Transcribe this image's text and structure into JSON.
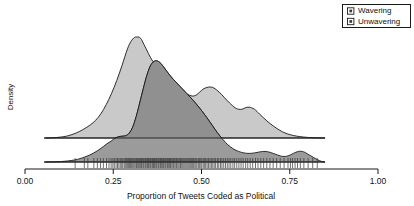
{
  "chart_data": {
    "type": "area",
    "title": "",
    "subtitle": "",
    "xlabel": "Proportion of Tweets Coded as Political",
    "ylabel": "Density",
    "xlim": [
      0.0,
      1.0
    ],
    "ylim": [
      0,
      1
    ],
    "grid": false,
    "legend_position": "top-right",
    "xticks": [
      0.0,
      0.25,
      0.5,
      0.75,
      1.0
    ],
    "xticklabels": [
      "0.00",
      "0.25",
      "0.50",
      "0.75",
      "1.00"
    ],
    "yticks": [],
    "yticklabels": [],
    "series": [
      {
        "name": "Wavering",
        "fill": "#c9c9c9",
        "stroke": "#1a1a1a",
        "baseline_y": 138,
        "x": [
          0.055,
          0.09,
          0.12,
          0.145,
          0.165,
          0.185,
          0.2,
          0.215,
          0.23,
          0.245,
          0.26,
          0.275,
          0.29,
          0.3,
          0.31,
          0.32,
          0.325,
          0.33,
          0.335,
          0.345,
          0.355,
          0.365,
          0.375,
          0.385,
          0.4,
          0.415,
          0.43,
          0.445,
          0.455,
          0.465,
          0.475,
          0.485,
          0.495,
          0.505,
          0.515,
          0.525,
          0.535,
          0.55,
          0.565,
          0.58,
          0.595,
          0.605,
          0.615,
          0.625,
          0.635,
          0.65,
          0.665,
          0.685,
          0.705,
          0.73,
          0.76,
          0.8,
          0.85
        ],
        "values": [
          0.0,
          0.005,
          0.02,
          0.05,
          0.085,
          0.13,
          0.175,
          0.24,
          0.33,
          0.44,
          0.57,
          0.72,
          0.88,
          0.955,
          0.995,
          1.0,
          0.995,
          0.975,
          0.94,
          0.87,
          0.8,
          0.745,
          0.7,
          0.655,
          0.6,
          0.545,
          0.5,
          0.46,
          0.44,
          0.425,
          0.415,
          0.425,
          0.455,
          0.485,
          0.5,
          0.505,
          0.495,
          0.455,
          0.4,
          0.345,
          0.3,
          0.285,
          0.285,
          0.3,
          0.305,
          0.285,
          0.235,
          0.17,
          0.115,
          0.06,
          0.025,
          0.006,
          0.0
        ]
      },
      {
        "name": "Unwavering",
        "fill": "#9b9b9b",
        "stroke": "#1a1a1a",
        "baseline_y": 162,
        "x": [
          0.055,
          0.1,
          0.14,
          0.17,
          0.195,
          0.215,
          0.23,
          0.245,
          0.255,
          0.265,
          0.275,
          0.285,
          0.295,
          0.305,
          0.315,
          0.325,
          0.335,
          0.345,
          0.355,
          0.365,
          0.375,
          0.385,
          0.395,
          0.41,
          0.425,
          0.44,
          0.455,
          0.47,
          0.485,
          0.5,
          0.515,
          0.53,
          0.545,
          0.56,
          0.575,
          0.59,
          0.605,
          0.62,
          0.635,
          0.65,
          0.665,
          0.68,
          0.695,
          0.715,
          0.73,
          0.745,
          0.76,
          0.775,
          0.79,
          0.81,
          0.835,
          0.85
        ],
        "values": [
          0.0,
          0.004,
          0.02,
          0.05,
          0.09,
          0.135,
          0.175,
          0.21,
          0.235,
          0.25,
          0.255,
          0.26,
          0.285,
          0.345,
          0.45,
          0.585,
          0.725,
          0.855,
          0.95,
          0.995,
          1.0,
          0.975,
          0.93,
          0.86,
          0.8,
          0.745,
          0.69,
          0.635,
          0.575,
          0.51,
          0.44,
          0.365,
          0.29,
          0.225,
          0.17,
          0.13,
          0.105,
          0.09,
          0.085,
          0.09,
          0.1,
          0.105,
          0.095,
          0.07,
          0.055,
          0.06,
          0.085,
          0.105,
          0.1,
          0.06,
          0.012,
          0.0
        ]
      }
    ],
    "rug": {
      "name": "observations-rug",
      "y_top": 158,
      "y_bottom": 168,
      "color": "#333333",
      "values": [
        0.142,
        0.168,
        0.178,
        0.195,
        0.205,
        0.214,
        0.222,
        0.231,
        0.238,
        0.244,
        0.249,
        0.253,
        0.258,
        0.262,
        0.266,
        0.27,
        0.274,
        0.277,
        0.281,
        0.284,
        0.287,
        0.29,
        0.293,
        0.296,
        0.299,
        0.302,
        0.305,
        0.308,
        0.311,
        0.314,
        0.316,
        0.319,
        0.322,
        0.324,
        0.327,
        0.33,
        0.332,
        0.335,
        0.337,
        0.34,
        0.342,
        0.345,
        0.347,
        0.35,
        0.352,
        0.355,
        0.357,
        0.36,
        0.362,
        0.364,
        0.367,
        0.369,
        0.372,
        0.374,
        0.377,
        0.379,
        0.382,
        0.384,
        0.387,
        0.389,
        0.392,
        0.394,
        0.397,
        0.399,
        0.402,
        0.404,
        0.407,
        0.409,
        0.412,
        0.414,
        0.417,
        0.42,
        0.422,
        0.425,
        0.428,
        0.43,
        0.433,
        0.436,
        0.439,
        0.441,
        0.444,
        0.447,
        0.45,
        0.453,
        0.456,
        0.459,
        0.462,
        0.465,
        0.468,
        0.471,
        0.474,
        0.477,
        0.481,
        0.484,
        0.487,
        0.491,
        0.494,
        0.498,
        0.501,
        0.505,
        0.509,
        0.512,
        0.516,
        0.52,
        0.524,
        0.528,
        0.532,
        0.536,
        0.54,
        0.545,
        0.549,
        0.554,
        0.558,
        0.563,
        0.568,
        0.573,
        0.578,
        0.583,
        0.589,
        0.594,
        0.6,
        0.606,
        0.612,
        0.618,
        0.625,
        0.631,
        0.638,
        0.645,
        0.653,
        0.66,
        0.668,
        0.676,
        0.685,
        0.694,
        0.703,
        0.713,
        0.723,
        0.734,
        0.745,
        0.752,
        0.758,
        0.765,
        0.772,
        0.78,
        0.79,
        0.802,
        0.815,
        0.828
      ]
    }
  },
  "legend": {
    "name": "series-legend",
    "entries": [
      {
        "label": "Wavering",
        "swatch_fill": "#c9c9c9"
      },
      {
        "label": "Unwavering",
        "swatch_fill": "#9b9b9b"
      }
    ]
  }
}
